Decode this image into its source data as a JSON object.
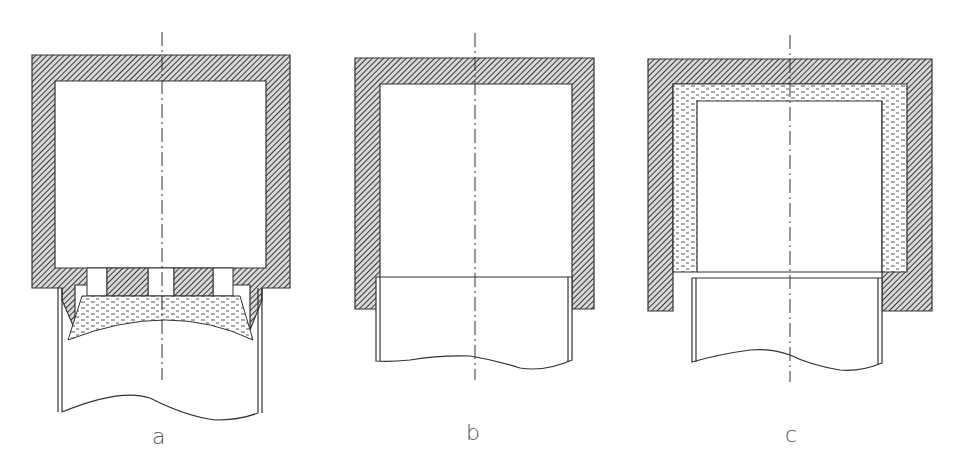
{
  "figure": {
    "panels": [
      {
        "id": "a",
        "label": "a",
        "description": "Cylinder with perforated bottom plate, fill layer beneath, inserted tube"
      },
      {
        "id": "b",
        "label": "b",
        "description": "Cylinder housing with inserted tube, no fill"
      },
      {
        "id": "c",
        "label": "c",
        "description": "Cylinder housing with fill lining on inner walls, inserted tube"
      }
    ],
    "colors": {
      "line": "#333333",
      "hatch": "#444444",
      "fill_dash": "#555555",
      "background": "#ffffff"
    },
    "legend": {
      "hatch": "solid wall (hatched)",
      "dashed_fill": "fill material (dashed)"
    }
  }
}
